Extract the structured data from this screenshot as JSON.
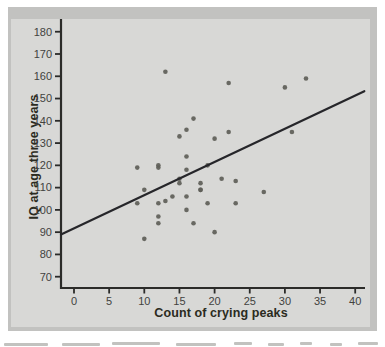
{
  "figure_panel": {
    "background": "#d8d8d6",
    "frame_color": "#c2c2c0"
  },
  "chart_data": {
    "type": "scatter",
    "title": "",
    "xlabel": "Count of crying peaks",
    "ylabel": "IQ at age three years",
    "xlim": [
      -2,
      42
    ],
    "ylim": [
      65,
      185
    ],
    "x_ticks": [
      0,
      5,
      10,
      15,
      20,
      25,
      30,
      35,
      40
    ],
    "y_ticks": [
      70,
      80,
      90,
      100,
      110,
      120,
      130,
      140,
      150,
      160,
      170,
      180
    ],
    "grid": false,
    "legend": false,
    "points": [
      [
        10,
        87
      ],
      [
        20,
        90
      ],
      [
        17,
        94
      ],
      [
        12,
        94
      ],
      [
        12,
        97
      ],
      [
        16,
        100
      ],
      [
        19,
        103
      ],
      [
        12,
        103
      ],
      [
        9,
        103
      ],
      [
        23,
        103
      ],
      [
        13,
        104
      ],
      [
        14,
        106
      ],
      [
        16,
        106
      ],
      [
        27,
        108
      ],
      [
        18,
        109
      ],
      [
        10,
        109
      ],
      [
        18,
        109
      ],
      [
        15,
        112
      ],
      [
        18,
        112
      ],
      [
        23,
        113
      ],
      [
        15,
        114
      ],
      [
        21,
        114
      ],
      [
        16,
        118
      ],
      [
        9,
        119
      ],
      [
        12,
        119
      ],
      [
        12,
        120
      ],
      [
        19,
        120
      ],
      [
        16,
        124
      ],
      [
        20,
        132
      ],
      [
        15,
        133
      ],
      [
        22,
        135
      ],
      [
        31,
        135
      ],
      [
        16,
        136
      ],
      [
        17,
        141
      ],
      [
        30,
        155
      ],
      [
        22,
        157
      ],
      [
        33,
        159
      ],
      [
        13,
        162
      ]
    ],
    "trend_line": {
      "x1": -1.85,
      "y1": 88.9,
      "x2": 41.3,
      "y2": 153.3
    },
    "colors": {
      "point": "#5e5e58",
      "line": "#26262a",
      "axis": "#2b2b29",
      "tick_label": "#42423e",
      "axis_title": "#2b2b21",
      "plot_bg": "#d8d8d6",
      "frame": "#c2c2c0"
    }
  }
}
